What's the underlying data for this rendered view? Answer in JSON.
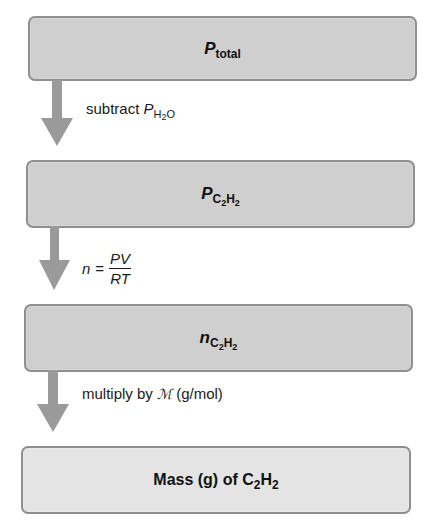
{
  "diagram": {
    "type": "flowchart",
    "direction": "top-to-bottom",
    "colors": {
      "box_fill": "#cfcfcf",
      "final_box_fill": "#e4e4e4",
      "box_border": "#8f8f8f",
      "arrow": "#9a9a9a",
      "text": "#111111"
    },
    "boxes": [
      {
        "id": "p_total",
        "symbol": "P",
        "subscript": "total",
        "text": "P_total"
      },
      {
        "id": "p_c2h2",
        "symbol": "P",
        "subscript_parts": [
          "C",
          "2",
          "H",
          "2"
        ],
        "text": "P_C2H2"
      },
      {
        "id": "n_c2h2",
        "symbol": "n",
        "subscript_parts": [
          "C",
          "2",
          "H",
          "2"
        ],
        "text": "n_C2H2"
      },
      {
        "id": "mass_c2h2",
        "prefix": "Mass (g) of C",
        "sub1": "2",
        "mid": "H",
        "sub2": "2",
        "text": "Mass (g) of C2H2"
      }
    ],
    "steps": [
      {
        "from": "p_total",
        "to": "p_c2h2",
        "prefix": "subtract ",
        "symbol": "P",
        "subscript_a": "H",
        "subscript_b": "2",
        "subscript_c": "O",
        "text": "subtract P_H2O"
      },
      {
        "from": "p_c2h2",
        "to": "n_c2h2",
        "lhs": "n",
        "equals": "=",
        "numerator": "PV",
        "denominator": "RT",
        "text": "n = PV/RT"
      },
      {
        "from": "n_c2h2",
        "to": "mass_c2h2",
        "prefix": "multiply by ",
        "symbol": "ℳ",
        "suffix": " (g/mol)",
        "text": "multiply by M (g/mol)"
      }
    ]
  }
}
